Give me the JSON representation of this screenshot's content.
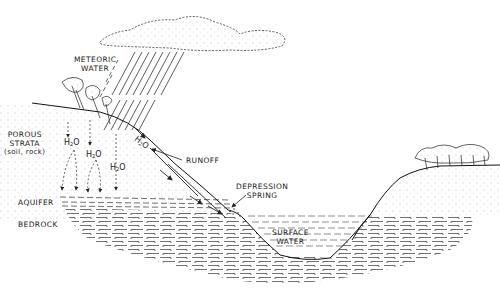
{
  "diagram": {
    "type": "hydrologic cross-section illustration",
    "style": "black ink line drawing on white",
    "colors": {
      "ink": "#1a1a1a",
      "background": "#ffffff",
      "stipple": "#555555"
    },
    "labels": {
      "meteoric_water": [
        "METEORIC",
        "WATER"
      ],
      "porous_strata": [
        "POROUS",
        "STRATA",
        "(soil, rock)"
      ],
      "aquifer": "AQUIFER",
      "bedrock": "BEDROCK",
      "runoff": "RUNOFF",
      "depression_spring": [
        "DEPRESSION",
        "SPRING"
      ],
      "surface_water": [
        "SURFACE",
        "WATER"
      ]
    },
    "h2o_markers": [
      {
        "id": "infiltration-1",
        "text": "H",
        "sub": "2",
        "tail": "O"
      },
      {
        "id": "infiltration-2",
        "text": "H",
        "sub": "2",
        "tail": "O"
      },
      {
        "id": "infiltration-3",
        "text": "H",
        "sub": "2",
        "tail": "O"
      },
      {
        "id": "runoff-flow",
        "text": "H",
        "sub": "2",
        "tail": "O"
      }
    ],
    "elements": [
      "cloud",
      "rain",
      "left-hill-with-trees",
      "infiltration-arrows",
      "runoff-arrows",
      "aquifer-layer",
      "bedrock-layer",
      "valley-lake",
      "right-hill-with-trees"
    ]
  }
}
